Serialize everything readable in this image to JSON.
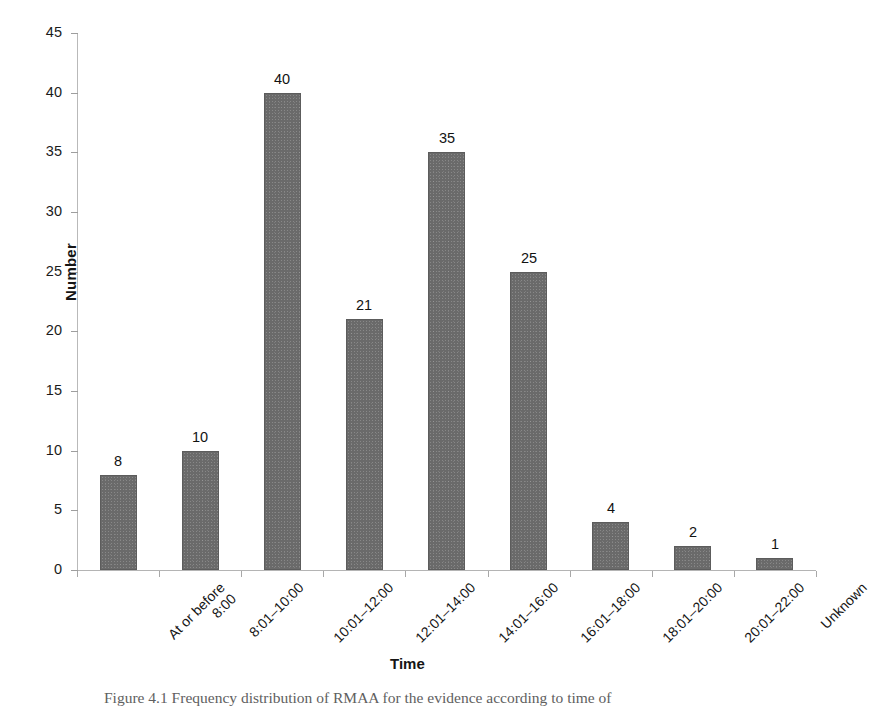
{
  "figure": {
    "caption": "Figure 4.1 Frequency distribution of RMAA for the evidence according to time of"
  },
  "chart_data": {
    "type": "bar",
    "title": "",
    "xlabel": "Time",
    "ylabel": "Number",
    "categories": [
      "At or before\n8:00",
      "8:01–10:00",
      "10:01–12:00",
      "12:01–14:00",
      "14:01–16:00",
      "16:01–18:00",
      "18:01–20:00",
      "20:01–22:00",
      "Unknown"
    ],
    "values": [
      8,
      10,
      40,
      21,
      35,
      25,
      4,
      2,
      1
    ],
    "data_labels": [
      "8",
      "10",
      "40",
      "21",
      "35",
      "25",
      "4",
      "2",
      "1"
    ],
    "ylim": [
      0,
      45
    ],
    "ytick_values": [
      0,
      5,
      10,
      15,
      20,
      25,
      30,
      35,
      40,
      45
    ],
    "ytick_labels": [
      "0",
      "5",
      "10",
      "15",
      "20",
      "25",
      "30",
      "35",
      "40",
      "45"
    ],
    "grid": false,
    "legend": false,
    "bar_color": "#6a6a6a",
    "axis_color": "#b4b4b4",
    "text_color": "#151515"
  }
}
